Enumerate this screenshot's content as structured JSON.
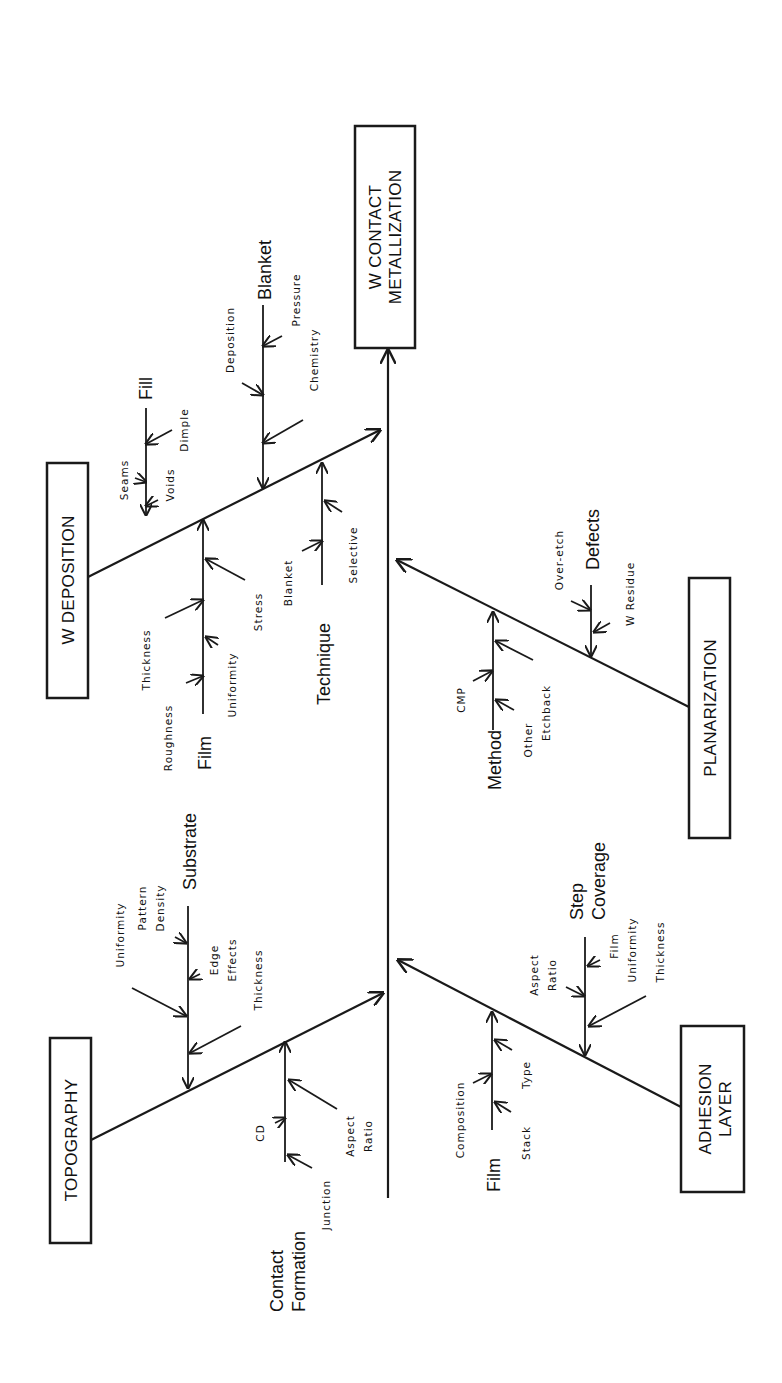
{
  "diagram": {
    "type": "fishbone",
    "orientation": "rotated-90-ccw",
    "effect": {
      "line1": "W CONTACT",
      "line2": "METALLIZATION"
    },
    "categories": [
      {
        "id": "w_deposition",
        "label": "W DEPOSITION",
        "sub_branches": [
          {
            "label": "Fill",
            "causes": [
              "Seams",
              "Voids",
              "Dimple"
            ]
          },
          {
            "label": "Blanket",
            "causes": [
              "Deposition",
              "Pressure",
              "Chemistry"
            ]
          },
          {
            "label": "Film",
            "causes": [
              "Thickness",
              "Roughness",
              "Uniformity",
              "Stress"
            ]
          },
          {
            "label": "Technique",
            "causes": [
              "Blanket",
              "Selective"
            ]
          }
        ]
      },
      {
        "id": "topography",
        "label": "TOPOGRAPHY",
        "sub_branches": [
          {
            "label": "Substrate",
            "causes": [
              "Uniformity",
              "Pattern Density",
              "Edge Effects",
              "Thickness"
            ]
          },
          {
            "label_line1": "Contact",
            "label_line2": "Formation",
            "label": "Contact Formation",
            "causes": [
              "CD",
              "Junction",
              "Aspect Ratio"
            ]
          }
        ]
      },
      {
        "id": "planarization",
        "label": "PLANARIZATION",
        "sub_branches": [
          {
            "label": "Defects",
            "causes": [
              "Over-etch",
              "W Residue"
            ]
          },
          {
            "label": "Method",
            "causes": [
              "CMP",
              "Other",
              "Etchback"
            ]
          }
        ]
      },
      {
        "id": "adhesion_layer",
        "label_line1": "ADHESION",
        "label_line2": "LAYER",
        "label": "ADHESION LAYER",
        "sub_branches": [
          {
            "label_line1": "Step",
            "label_line2": "Coverage",
            "label": "Step Coverage",
            "causes": [
              "Aspect Ratio",
              "Film Uniformity",
              "Thickness"
            ]
          },
          {
            "label": "Film",
            "causes": [
              "Composition",
              "Stack",
              "Type"
            ]
          }
        ]
      }
    ],
    "text": {
      "head1": "W CONTACT",
      "head2": "METALLIZATION",
      "wdep": "W DEPOSITION",
      "topo": "TOPOGRAPHY",
      "plan": "PLANARIZATION",
      "adh1": "ADHESION",
      "adh2": "LAYER",
      "fill": "Fill",
      "seams": "Seams",
      "voids": "Voids",
      "dimple": "Dimple",
      "blanket": "Blanket",
      "deposition": "Deposition",
      "pressure": "Pressure",
      "chemistry": "Chemistry",
      "film": "Film",
      "thickness": "Thickness",
      "roughness": "Roughness",
      "uniformity": "Uniformity",
      "stress": "Stress",
      "technique": "Technique",
      "tech_blanket": "Blanket",
      "selective": "Selective",
      "substrate": "Substrate",
      "sub_uniformity": "Uniformity",
      "pattern": "Pattern",
      "density": "Density",
      "edge": "Edge",
      "effects": "Effects",
      "sub_thickness": "Thickness",
      "contact": "Contact",
      "formation": "Formation",
      "cd": "CD",
      "junction": "Junction",
      "aspect": "Aspect",
      "ratio": "Ratio",
      "defects": "Defects",
      "overetch": "Over-etch",
      "wresidue": "W Residue",
      "method": "Method",
      "cmp": "CMP",
      "other": "Other",
      "etchback": "Etchback",
      "step": "Step",
      "coverage": "Coverage",
      "sc_aspect": "Aspect",
      "sc_ratio": "Ratio",
      "sc_film": "Film",
      "sc_uniformity": "Uniformity",
      "sc_thickness": "Thickness",
      "adh_film": "Film",
      "composition": "Composition",
      "stack": "Stack",
      "type": "Type"
    }
  }
}
